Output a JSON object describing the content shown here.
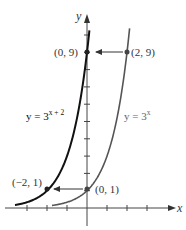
{
  "chart_data": {
    "type": "line",
    "title": "",
    "xlabel": "x",
    "ylabel": "y",
    "xlim": [
      -4,
      4.5
    ],
    "ylim": [
      -1.2,
      10.5
    ],
    "grid": false,
    "x_ticks": [
      -3,
      -2,
      -1,
      1,
      2,
      3
    ],
    "y_ticks": [
      1,
      2,
      3,
      4,
      5,
      6,
      7,
      8,
      9,
      10
    ],
    "series": [
      {
        "name": "y = 3^(x+2)",
        "label_base": "y = 3",
        "label_exp": "x + 2",
        "function": "3^(x+2)",
        "x_range": [
          -3.6,
          0.12
        ],
        "color": "#111111",
        "stroke_width": 2
      },
      {
        "name": "y = 3^x",
        "label_base": "y = 3",
        "label_exp": "x",
        "function": "3^x",
        "x_range": [
          -1.75,
          2.13
        ],
        "color": "#555555",
        "stroke_width": 1.6
      }
    ],
    "points": [
      {
        "x": 0,
        "y": 9,
        "label": "(0, 9)",
        "label_side": "left"
      },
      {
        "x": 2,
        "y": 9,
        "label": "(2, 9)",
        "label_side": "right"
      },
      {
        "x": -2,
        "y": 1,
        "label": "(−2, 1)",
        "label_side": "left-above"
      },
      {
        "x": 0,
        "y": 1,
        "label": "(0, 1)",
        "label_side": "right"
      }
    ],
    "annotations": [
      {
        "type": "arrow",
        "from": [
          2,
          9
        ],
        "to": [
          0,
          9
        ],
        "description": "horizontal shift left by 2"
      },
      {
        "type": "arrow",
        "from": [
          0,
          1
        ],
        "to": [
          -2,
          1
        ],
        "description": "horizontal shift left by 2"
      }
    ]
  },
  "labels": {
    "x_axis": "x",
    "y_axis": "y",
    "eq_shifted_base": "y = 3",
    "eq_shifted_exp": "x + 2",
    "eq_base": "y = 3",
    "eq_base_exp": "x",
    "pt_0_9": "(0, 9)",
    "pt_2_9": "(2, 9)",
    "pt_m2_1": "(−2, 1)",
    "pt_0_1": "(0, 1)"
  }
}
